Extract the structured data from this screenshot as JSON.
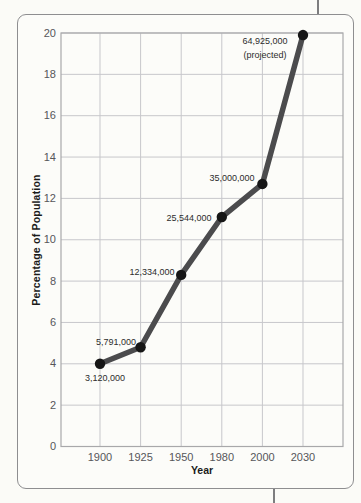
{
  "chart_data": {
    "type": "line",
    "title": "",
    "xlabel": "Year",
    "ylabel": "Percentage of Population",
    "categories": [
      "1900",
      "1925",
      "1950",
      "1980",
      "2000",
      "2030"
    ],
    "values": [
      4.0,
      4.8,
      8.3,
      11.1,
      12.7,
      19.9
    ],
    "point_labels": [
      [
        "3,120,000"
      ],
      [
        "5,791,000"
      ],
      [
        "12,334,000"
      ],
      [
        "25,544,000"
      ],
      [
        "35,000,000"
      ],
      [
        "64,925,000",
        "(projected)"
      ]
    ],
    "ylim": [
      0,
      20
    ],
    "ytick_step": 2,
    "ytick_labels": [
      "0",
      "2",
      "4",
      "6",
      "8",
      "10",
      "12",
      "14",
      "16",
      "18",
      "20"
    ],
    "grid": true,
    "legend": "none",
    "line_color": "#4b4b4d",
    "marker_color": "#161616",
    "grid_color": "#c7c7cb",
    "axis_color": "#a8a8aa",
    "tick_label_color": "#56565a",
    "point_label_color": "#2c2c2c",
    "label_pos_px": [
      [
        105,
        378
      ],
      [
        116,
        342
      ],
      [
        152,
        272
      ],
      [
        189,
        218
      ],
      [
        232,
        178
      ],
      [
        265,
        48
      ]
    ]
  }
}
